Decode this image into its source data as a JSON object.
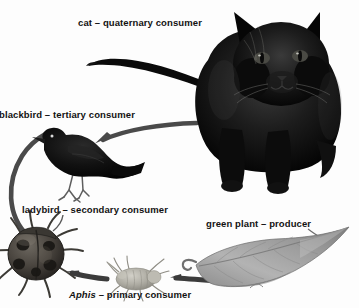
{
  "diagram": {
    "background_color": "#fdfdfd",
    "ink_color": "#121212",
    "labels": {
      "cat": "cat – quaternary consumer",
      "blackbird": "blackbird – tertiary consumer",
      "ladybird": "ladybird – secondary consumer",
      "green_plant": "green plant – producer",
      "aphis_italic": "Aphis",
      "aphis_rest": " – primary consumer"
    },
    "organisms": [
      {
        "name": "cat",
        "role": "quaternary consumer",
        "icon": "black-cat-illustration"
      },
      {
        "name": "blackbird",
        "role": "tertiary consumer",
        "icon": "blackbird-illustration"
      },
      {
        "name": "ladybird",
        "role": "secondary consumer",
        "icon": "ladybird-beetle-illustration"
      },
      {
        "name": "Aphis",
        "role": "primary consumer",
        "icon": "aphid-illustration"
      },
      {
        "name": "green plant",
        "role": "producer",
        "icon": "leaf-illustration"
      }
    ],
    "arrows": [
      {
        "from": "green plant",
        "to": "Aphis",
        "icon": "energy-flow-arrow"
      },
      {
        "from": "Aphis",
        "to": "ladybird",
        "icon": "energy-flow-arrow"
      },
      {
        "from": "ladybird",
        "to": "blackbird",
        "icon": "energy-flow-arrow"
      },
      {
        "from": "blackbird",
        "to": "cat",
        "icon": "energy-flow-arrow"
      }
    ]
  }
}
